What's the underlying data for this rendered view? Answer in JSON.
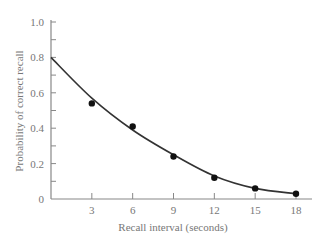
{
  "chart_data": {
    "type": "scatter",
    "title": "",
    "xlabel": "Recall interval (seconds)",
    "ylabel": "Probability of correct recall",
    "xlim": [
      0,
      19
    ],
    "ylim": [
      0,
      1.0
    ],
    "x_ticks": [
      3,
      6,
      9,
      12,
      15,
      18
    ],
    "x_tick_labels": [
      "3",
      "6",
      "9",
      "12",
      "15",
      "18"
    ],
    "y_ticks": [
      0,
      0.2,
      0.4,
      0.6,
      0.8,
      1.0
    ],
    "y_tick_labels": [
      "0",
      "0.2",
      "0.4",
      "0.6",
      "0.8",
      "1.0"
    ],
    "y_minor_step": 0.1,
    "grid": false,
    "legend": null,
    "series": [
      {
        "name": "Observed data",
        "kind": "points",
        "x": [
          3,
          6,
          9,
          12,
          15,
          18
        ],
        "y": [
          0.54,
          0.41,
          0.24,
          0.12,
          0.06,
          0.03
        ],
        "color": "#111111"
      },
      {
        "name": "Fitted curve",
        "kind": "line",
        "x": [
          0,
          3,
          6,
          9,
          12,
          15,
          18
        ],
        "y": [
          0.8,
          0.57,
          0.39,
          0.25,
          0.13,
          0.06,
          0.03
        ],
        "color": "#333333"
      }
    ]
  },
  "colors": {
    "axis": "#888888",
    "labels": "#777777",
    "curve": "#333333",
    "points": "#111111"
  }
}
